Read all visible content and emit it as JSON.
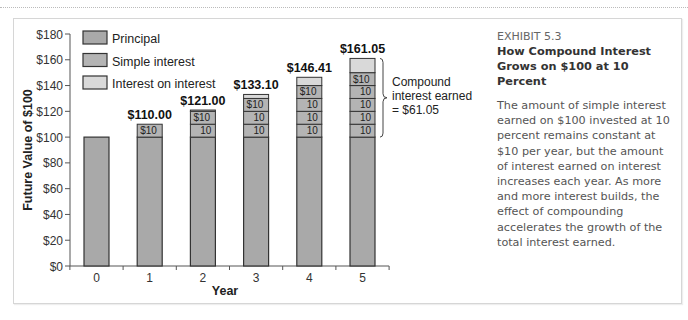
{
  "exhibit": {
    "label": "EXHIBIT 5.3",
    "title": "How Compound Interest Grows on $100 at 10 Percent",
    "description": "The amount of simple interest earned on $100 invested at 10 percent remains constant at $10 per year, but the amount of interest earned on interest increases each year. As more and more interest builds, the effect of compounding accelerates the growth of the total interest earned."
  },
  "colors": {
    "principal": "#a9a9a9",
    "simple_interest": "#b4b4b4",
    "interest_on_interest": "#d9d9d9",
    "outline": "#333333"
  },
  "chart_data": {
    "type": "bar",
    "stacked": true,
    "title": "How Compound Interest Grows on $100 at 10 Percent",
    "xlabel": "Year",
    "ylabel": "Future Value of $100",
    "categories": [
      "0",
      "1",
      "2",
      "3",
      "4",
      "5"
    ],
    "yticks": [
      "$0",
      "$20",
      "$40",
      "$60",
      "$80",
      "$100",
      "$120",
      "$140",
      "$160",
      "$180"
    ],
    "ylim": [
      0,
      180
    ],
    "grid": false,
    "legend_position": "top-left",
    "legend": [
      "Principal",
      "Simple interest",
      "Interest on interest"
    ],
    "series": [
      {
        "name": "Principal",
        "values": [
          100,
          100,
          100,
          100,
          100,
          100
        ]
      },
      {
        "name": "Simple interest",
        "values": [
          0,
          10,
          20,
          30,
          40,
          50
        ]
      },
      {
        "name": "Interest on interest",
        "values": [
          0,
          0,
          1.0,
          3.1,
          6.41,
          11.05
        ]
      }
    ],
    "totals": [
      100,
      110.0,
      121.0,
      133.1,
      146.41,
      161.05
    ],
    "total_labels": [
      "",
      "$110.00",
      "$121.00",
      "$133.10",
      "$146.41",
      "$161.05"
    ],
    "segment_labels": {
      "first": "$10",
      "rest": "10"
    },
    "annotation": {
      "text": [
        "Compound",
        "interest earned",
        "= $61.05"
      ],
      "target_year": "5"
    }
  }
}
